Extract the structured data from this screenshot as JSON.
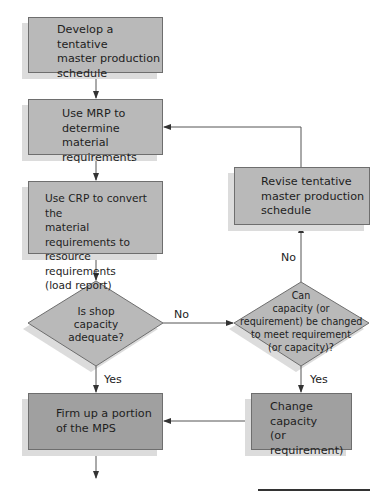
{
  "flowchart": {
    "nodes": {
      "develop": {
        "type": "process",
        "lines": [
          "Develop a tentative",
          "master production",
          "schedule"
        ]
      },
      "mrp": {
        "type": "process",
        "lines": [
          "Use MRP to",
          "determine material",
          "requirements"
        ]
      },
      "crp": {
        "type": "process",
        "lines": [
          "Use CRP to convert the",
          "material requirements to",
          "resource requirements",
          "(load report)"
        ]
      },
      "shop_capacity": {
        "type": "decision",
        "lines": [
          "Is shop",
          "capacity",
          "adequate?"
        ]
      },
      "firm_up": {
        "type": "process",
        "lines": [
          "Firm up a portion",
          "of the MPS"
        ]
      },
      "revise": {
        "type": "process",
        "lines": [
          "Revise tentative",
          "master production",
          "schedule"
        ]
      },
      "can_change": {
        "type": "decision",
        "lines": [
          "Can",
          "capacity (or",
          "requirement) be changed",
          "to meet requirement",
          "(or capacity)?"
        ]
      },
      "change": {
        "type": "process",
        "lines": [
          "Change",
          "capacity",
          "(or requirement)"
        ]
      }
    },
    "edge_labels": {
      "shop_no": "No",
      "shop_yes": "Yes",
      "change_no": "No",
      "change_yes": "Yes"
    },
    "edges": [
      {
        "from": "develop",
        "to": "mrp"
      },
      {
        "from": "mrp",
        "to": "crp"
      },
      {
        "from": "crp",
        "to": "shop_capacity"
      },
      {
        "from": "shop_capacity",
        "to": "firm_up",
        "label": "Yes"
      },
      {
        "from": "shop_capacity",
        "to": "can_change",
        "label": "No"
      },
      {
        "from": "can_change",
        "to": "revise",
        "label": "No"
      },
      {
        "from": "revise",
        "to": "mrp"
      },
      {
        "from": "can_change",
        "to": "change",
        "label": "Yes"
      },
      {
        "from": "change",
        "to": "firm_up"
      }
    ],
    "colors": {
      "process_fill": "#b9b9b9",
      "final_fill": "#a0a0a0",
      "shadow": "#dcdcdc",
      "stroke": "#6e6e6e"
    }
  }
}
